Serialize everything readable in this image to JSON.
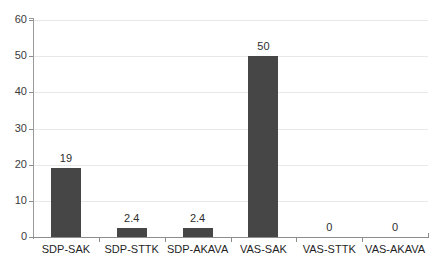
{
  "chart_data": {
    "type": "bar",
    "title": "",
    "subtitle": "",
    "xlabel": "",
    "ylabel": "",
    "categories": [
      "SDP-SAK",
      "SDP-STTK",
      "SDP-AKAVA",
      "VAS-SAK",
      "VAS-STTK",
      "VAS-AKAVA"
    ],
    "values": [
      19,
      2.4,
      2.4,
      50,
      0,
      0
    ],
    "value_labels": [
      "19",
      "2.4",
      "2.4",
      "50",
      "0",
      "0"
    ],
    "ylim": [
      0,
      60
    ],
    "ytick_values": [
      0,
      10,
      20,
      30,
      40,
      50,
      60
    ],
    "ytick_labels": [
      "0",
      "10",
      "20",
      "30",
      "40",
      "50",
      "60"
    ],
    "grid": "horizontal",
    "legend": "none",
    "bar_color": "#464646",
    "grid_color": "#e8e8e8",
    "axis_color": "#8d8d8d",
    "background": "#ffffff"
  }
}
